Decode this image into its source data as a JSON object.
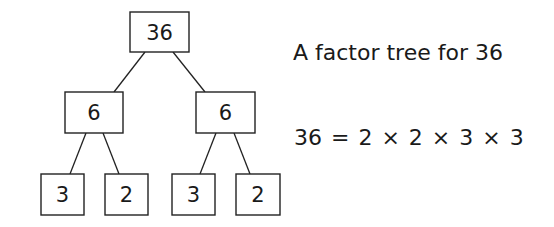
{
  "tree": {
    "root": {
      "label": "36"
    },
    "level1": [
      {
        "label": "6"
      },
      {
        "label": "6"
      }
    ],
    "leaves": [
      {
        "label": "3"
      },
      {
        "label": "2"
      },
      {
        "label": "3"
      },
      {
        "label": "2"
      }
    ]
  },
  "caption": "A factor tree for 36",
  "equation": "36 = 2 × 2 × 3 × 3"
}
